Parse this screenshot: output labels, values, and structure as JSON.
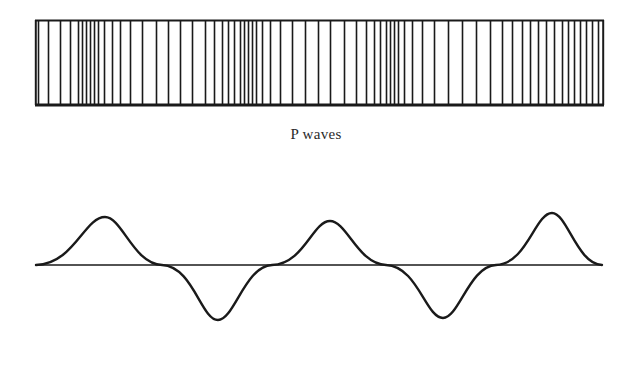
{
  "figure": {
    "background_color": "#ffffff",
    "ink_color": "#1a1a1a",
    "width": 632,
    "height": 367
  },
  "panels": [
    {
      "id": "p-wave-panel",
      "caption": "P waves",
      "wave_type": "compressional-push-pull",
      "description": "Bar diagram of compressions and rarefactions represented by vertical lines of varying spacing inside a rectangular frame"
    },
    {
      "id": "s-wave-panel",
      "caption": "S waves",
      "wave_type": "transverse-sine",
      "description": "Sinusoidal transverse wave crossing a horizontal baseline, three crests and two troughs"
    }
  ],
  "chart_data": [
    {
      "type": "bar",
      "title": "P waves",
      "xlabel": "",
      "ylabel": "",
      "grid": false,
      "legend": null,
      "frame": {
        "x0": 35,
        "y0": 20,
        "x1": 604,
        "y1": 105
      },
      "categories": [],
      "values": [],
      "line_positions": [
        38,
        48,
        60,
        70,
        78,
        82,
        86,
        90,
        94,
        98,
        104,
        112,
        120,
        130,
        142,
        156,
        168,
        180,
        192,
        205,
        214,
        222,
        228,
        234,
        240,
        244,
        248,
        252,
        256,
        262,
        270,
        280,
        292,
        305,
        318,
        330,
        344,
        356,
        366,
        374,
        380,
        386,
        390,
        394,
        398,
        404,
        412,
        422,
        434,
        448,
        462,
        476,
        490,
        502,
        512,
        522,
        530,
        538,
        546,
        554,
        562,
        568,
        574,
        580,
        586,
        592,
        598
      ],
      "line_color": "#1a1a1a",
      "line_width": 1.6,
      "frame_line_width": 2.2,
      "note": "Line x-positions in pixels; clusters indicate compressions, wide gaps indicate rarefactions"
    },
    {
      "type": "line",
      "title": "S waves",
      "xlabel": "",
      "ylabel": "",
      "grid": false,
      "legend": null,
      "baseline_y": 265,
      "x_start": 36,
      "x_end": 602,
      "amplitude": 48,
      "cycles": 2.75,
      "xlim": [
        36,
        602
      ],
      "ylim": [
        217,
        320
      ],
      "crests": [
        {
          "x": 105,
          "y": 217
        },
        {
          "x": 330,
          "y": 221
        },
        {
          "x": 552,
          "y": 213
        }
      ],
      "troughs": [
        {
          "x": 218,
          "y": 320
        },
        {
          "x": 443,
          "y": 318
        }
      ],
      "zero_crossings": [
        36,
        162,
        272,
        386,
        496,
        602
      ],
      "line_color": "#1a1a1a",
      "line_width": 2.4,
      "baseline_width": 1.4
    }
  ]
}
